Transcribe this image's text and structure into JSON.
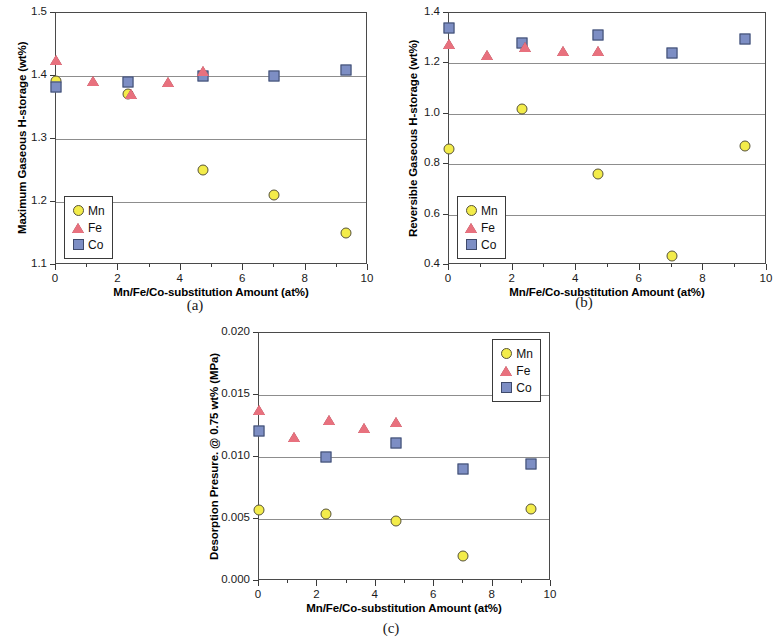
{
  "figure": {
    "background": "#ffffff",
    "series_colors": {
      "Mn": "#f3ec4a",
      "Fe": "#e8717e",
      "Co": "#7d8ec4"
    }
  },
  "panels": [
    {
      "key": "a",
      "caption": "(a)",
      "legend_position": "bottom-left",
      "chart_data": {
        "type": "scatter",
        "title": "",
        "xlabel": "Mn/Fe/Co-substitution Amount (at%)",
        "ylabel": "Maximum Gaseous H-storage (wt%)",
        "xlim": [
          0,
          10
        ],
        "ylim": [
          1.1,
          1.5
        ],
        "xticks": [
          0,
          2,
          4,
          6,
          8,
          10
        ],
        "xticklabels": [
          "0",
          "2",
          "4",
          "6",
          "8",
          "10"
        ],
        "yticks": [
          1.1,
          1.2,
          1.3,
          1.4,
          1.5
        ],
        "yticklabels": [
          "1.1",
          "1.2",
          "1.3",
          "1.4",
          "1.5"
        ],
        "grid": true,
        "legend_entries": [
          "Mn",
          "Fe",
          "Co"
        ],
        "series": [
          {
            "name": "Mn",
            "marker": "circle",
            "x": [
              0.0,
              2.3,
              4.7,
              7.0,
              9.3
            ],
            "y": [
              1.392,
              1.372,
              1.251,
              1.211,
              1.151
            ]
          },
          {
            "name": "Fe",
            "marker": "triangle",
            "x": [
              0.0,
              1.2,
              2.4,
              3.6,
              4.7
            ],
            "y": [
              1.425,
              1.392,
              1.371,
              1.391,
              1.408
            ]
          },
          {
            "name": "Co",
            "marker": "square",
            "x": [
              0.0,
              2.3,
              4.7,
              7.0,
              9.3
            ],
            "y": [
              1.383,
              1.391,
              1.4,
              1.4,
              1.41
            ]
          }
        ]
      }
    },
    {
      "key": "b",
      "caption": "(b)",
      "legend_position": "bottom-left",
      "chart_data": {
        "type": "scatter",
        "title": "",
        "xlabel": "Mn/Fe/Co-substitution Amount (at%)",
        "ylabel": "Reversible Gaseous H-storage (wt%)",
        "xlim": [
          0,
          10
        ],
        "ylim": [
          0.4,
          1.4
        ],
        "xticks": [
          0,
          2,
          4,
          6,
          8,
          10
        ],
        "xticklabels": [
          "0",
          "2",
          "4",
          "6",
          "8",
          "10"
        ],
        "yticks": [
          0.4,
          0.6,
          0.8,
          1.0,
          1.2,
          1.4
        ],
        "yticklabels": [
          "0.4",
          "0.6",
          "0.8",
          "1.0",
          "1.2",
          "1.4"
        ],
        "grid": true,
        "legend_entries": [
          "Mn",
          "Fe",
          "Co"
        ],
        "series": [
          {
            "name": "Mn",
            "marker": "circle",
            "x": [
              0.0,
              2.3,
              4.7,
              7.0,
              9.3
            ],
            "y": [
              0.862,
              1.021,
              0.762,
              0.435,
              0.874
            ]
          },
          {
            "name": "Fe",
            "marker": "triangle",
            "x": [
              0.0,
              1.2,
              2.4,
              3.6,
              4.7
            ],
            "y": [
              1.278,
              1.232,
              1.266,
              1.249,
              1.25
            ]
          },
          {
            "name": "Co",
            "marker": "square",
            "x": [
              0.0,
              2.3,
              4.7,
              7.0,
              9.3
            ],
            "y": [
              1.341,
              1.281,
              1.313,
              1.242,
              1.296
            ]
          }
        ]
      }
    },
    {
      "key": "c",
      "caption": "(c)",
      "legend_position": "top-right",
      "chart_data": {
        "type": "scatter",
        "title": "",
        "xlabel": "Mn/Fe/Co-substitution Amount (at%)",
        "ylabel": "Desorption Presure. @ 0.75 wt% (MPa)",
        "xlim": [
          0,
          10
        ],
        "ylim": [
          0.0,
          0.02
        ],
        "xticks": [
          0,
          2,
          4,
          6,
          8,
          10
        ],
        "xticklabels": [
          "0",
          "2",
          "4",
          "6",
          "8",
          "10"
        ],
        "yticks": [
          0.0,
          0.005,
          0.01,
          0.015,
          0.02
        ],
        "yticklabels": [
          "0.000",
          "0.005",
          "0.010",
          "0.015",
          "0.020"
        ],
        "grid": true,
        "legend_entries": [
          "Mn",
          "Fe",
          "Co"
        ],
        "series": [
          {
            "name": "Mn",
            "marker": "circle",
            "x": [
              0.0,
              2.3,
              4.7,
              7.0,
              9.3
            ],
            "y": [
              0.0057,
              0.0054,
              0.0048,
              0.002,
              0.0058
            ]
          },
          {
            "name": "Fe",
            "marker": "triangle",
            "x": [
              0.0,
              1.2,
              2.4,
              3.6,
              4.7
            ],
            "y": [
              0.0138,
              0.0116,
              0.013,
              0.0123,
              0.0128
            ]
          },
          {
            "name": "Co",
            "marker": "square",
            "x": [
              0.0,
              2.3,
              4.7,
              7.0,
              9.3
            ],
            "y": [
              0.0121,
              0.01,
              0.0111,
              0.009,
              0.0094
            ]
          }
        ]
      }
    }
  ]
}
